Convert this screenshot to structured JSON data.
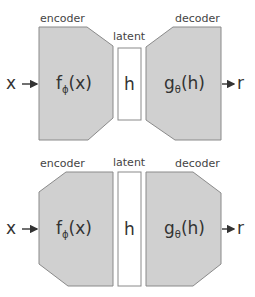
{
  "diagrams": [
    {
      "id": "undercomplete",
      "labels": {
        "encoder": "encoder",
        "latent": "latent",
        "decoder": "decoder"
      },
      "input": "x",
      "output": "r",
      "encoder_fn": {
        "base": "f",
        "sub": "ϕ",
        "arg": "(x)"
      },
      "latent_symbol": "h",
      "decoder_fn": {
        "base": "g",
        "sub": "θ",
        "arg": "(h)"
      }
    },
    {
      "id": "overcomplete",
      "labels": {
        "encoder": "encoder",
        "latent": "latent",
        "decoder": "decoder"
      },
      "input": "x",
      "output": "r",
      "encoder_fn": {
        "base": "f",
        "sub": "ϕ",
        "arg": "(x)"
      },
      "latent_symbol": "h",
      "decoder_fn": {
        "base": "g",
        "sub": "θ",
        "arg": "(h)"
      }
    }
  ],
  "colors": {
    "block_fill": "#d0d0d0",
    "block_stroke": "#8a8a8a",
    "latent_fill": "#ffffff",
    "text": "#333333"
  }
}
